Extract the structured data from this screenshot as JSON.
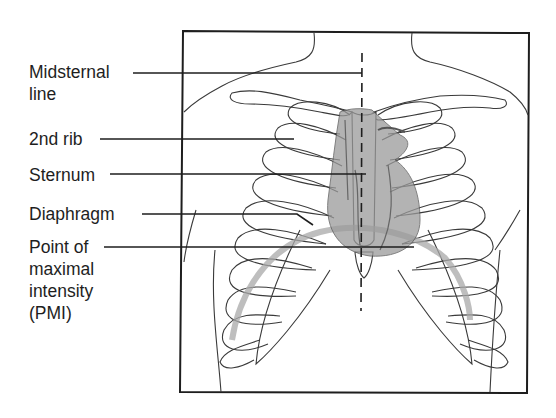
{
  "figure": {
    "labels": [
      {
        "id": "midsternal-line",
        "lines": [
          "Midsternal",
          "line"
        ]
      },
      {
        "id": "second-rib",
        "lines": [
          "2nd rib"
        ]
      },
      {
        "id": "sternum",
        "lines": [
          "Sternum"
        ]
      },
      {
        "id": "diaphragm",
        "lines": [
          "Diaphragm"
        ]
      },
      {
        "id": "pmi",
        "lines": [
          "Point of",
          "maximal",
          "intensity",
          "(PMI)"
        ]
      }
    ],
    "colors": {
      "ink": "#1e1e1e",
      "bone_outline": "#3a3a3a",
      "heart_fill": "#9a9a9a",
      "diaphragm_band": "#a8a8a8"
    }
  }
}
